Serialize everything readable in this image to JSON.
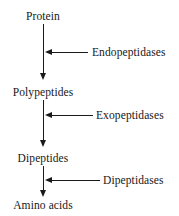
{
  "diagram": {
    "type": "flow-diagram",
    "background_color": "#ffffff",
    "line_color": "#1a1a1a",
    "text_color": "#171717",
    "nodes": [
      {
        "id": "protein",
        "label": "Protein",
        "x": 43,
        "y": 16
      },
      {
        "id": "polypeptides",
        "label": "Polypeptides",
        "x": 43,
        "y": 92
      },
      {
        "id": "dipeptides",
        "label": "Dipeptides",
        "x": 43,
        "y": 158
      },
      {
        "id": "aminoacids",
        "label": "Amino acids",
        "x": 43,
        "y": 205
      }
    ],
    "enzymes": [
      {
        "id": "endopeptidases",
        "label": "Endopeptidases",
        "x": 93,
        "y": 52
      },
      {
        "id": "exopeptidases",
        "label": "Exopeptidases",
        "x": 96,
        "y": 115
      },
      {
        "id": "dipeptidases",
        "label": "Dipeptidases",
        "x": 103,
        "y": 180
      }
    ],
    "edges": [
      {
        "id": "protein-to-polypeptides",
        "from": "protein",
        "to": "polypeptides",
        "direction": "down"
      },
      {
        "id": "polypeptides-to-dipeptides",
        "from": "polypeptides",
        "to": "dipeptides",
        "direction": "down"
      },
      {
        "id": "dipeptides-to-aminoacids",
        "from": "dipeptides",
        "to": "aminoacids",
        "direction": "down"
      },
      {
        "id": "endopeptidases-arrow",
        "from": "endopeptidases",
        "to": "protein-to-polypeptides",
        "direction": "left"
      },
      {
        "id": "exopeptidases-arrow",
        "from": "exopeptidases",
        "to": "polypeptides-to-dipeptides",
        "direction": "left"
      },
      {
        "id": "dipeptidases-arrow",
        "from": "dipeptidases",
        "to": "dipeptides-to-aminoacids",
        "direction": "left"
      }
    ]
  }
}
